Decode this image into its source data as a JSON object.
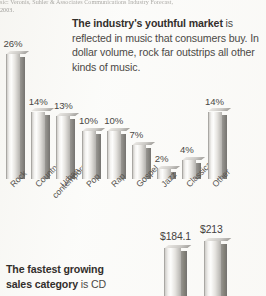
{
  "page": {
    "background_color": "#fbfbf9",
    "width": 266,
    "height": 296
  },
  "citation": {
    "line1": "sic: Veronis, Suhler & Associates Communications Industry Forecast,",
    "line2": "2003."
  },
  "body_copy": {
    "lead": "The industry's youthful market",
    "rest": " is reflected in music that consumers buy. In dollar volume, rock far outstrips all other kinds of music."
  },
  "bottom_copy": {
    "lead": "The fastest growing",
    "lead2": "sales category",
    "rest": " is CD"
  },
  "chart_data": [
    {
      "type": "bar",
      "title": "",
      "xlabel": "",
      "ylabel": "",
      "ylim": [
        0,
        27
      ],
      "grid": false,
      "legend": "none",
      "value_suffix": "%",
      "categories": [
        "Rock",
        "Country",
        "Urban contemporary",
        "Pop",
        "Rap",
        "Gospel",
        "Jazz",
        "Classical",
        "Other"
      ],
      "tick_labels": [
        {
          "line1": "Rock",
          "line2": ""
        },
        {
          "line1": "Country",
          "line2": ""
        },
        {
          "line1": "Urban",
          "line2": "contemporary"
        },
        {
          "line1": "Pop",
          "line2": ""
        },
        {
          "line1": "Rap",
          "line2": ""
        },
        {
          "line1": "Gospel",
          "line2": ""
        },
        {
          "line1": "Jazz",
          "line2": ""
        },
        {
          "line1": "Classical",
          "line2": ""
        },
        {
          "line1": "Other",
          "line2": ""
        }
      ],
      "values": [
        26,
        14,
        13,
        10,
        10,
        7,
        2,
        4,
        14
      ],
      "value_labels": [
        "26%",
        "14%",
        "13%",
        "10%",
        "10%",
        "7%",
        "2%",
        "4%",
        "14%"
      ]
    },
    {
      "type": "bar",
      "title": "",
      "xlabel": "",
      "ylabel": "",
      "ylim": [
        0,
        240
      ],
      "grid": false,
      "legend": "none",
      "value_prefix": "$",
      "categories": [
        "",
        ""
      ],
      "values": [
        184.1,
        213
      ],
      "value_labels": [
        "$184.1",
        "$213"
      ]
    }
  ]
}
